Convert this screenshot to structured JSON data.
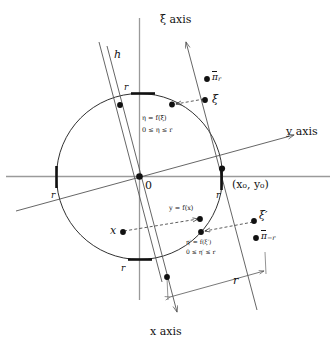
{
  "figure": {
    "kind": "geometric-diagram"
  },
  "axes": {
    "xi_axis_label": "ξ axis",
    "y_axis_label": "y axis",
    "x_axis_label": "x axis",
    "h_label": "h",
    "origin_label": "0"
  },
  "points": {
    "pi_r": "π",
    "pi_r_sub": "r",
    "xi": "ξ",
    "xi_prime": "ξ′",
    "pi_minus_r": "π",
    "pi_minus_r_sub": "−r",
    "x_point": "x",
    "coords": "(x₀, y₀)"
  },
  "annotations": {
    "upper_eq1": "η = f(ξ)",
    "upper_eq2": "0 ≤ η ≤ r",
    "mid_eq": "y = f(x)",
    "lower_eq1": "η′ = f(ξ′)",
    "lower_eq2": "0 ≤ η′ ≤ r"
  },
  "radius_ticks": {
    "top": "r",
    "left": "r",
    "right": "r",
    "bottom": "r",
    "strip_width": "r"
  },
  "colors": {
    "ink": "#111111",
    "axis_gray": "#8d8d8d",
    "curve": "#1a1a1a"
  }
}
